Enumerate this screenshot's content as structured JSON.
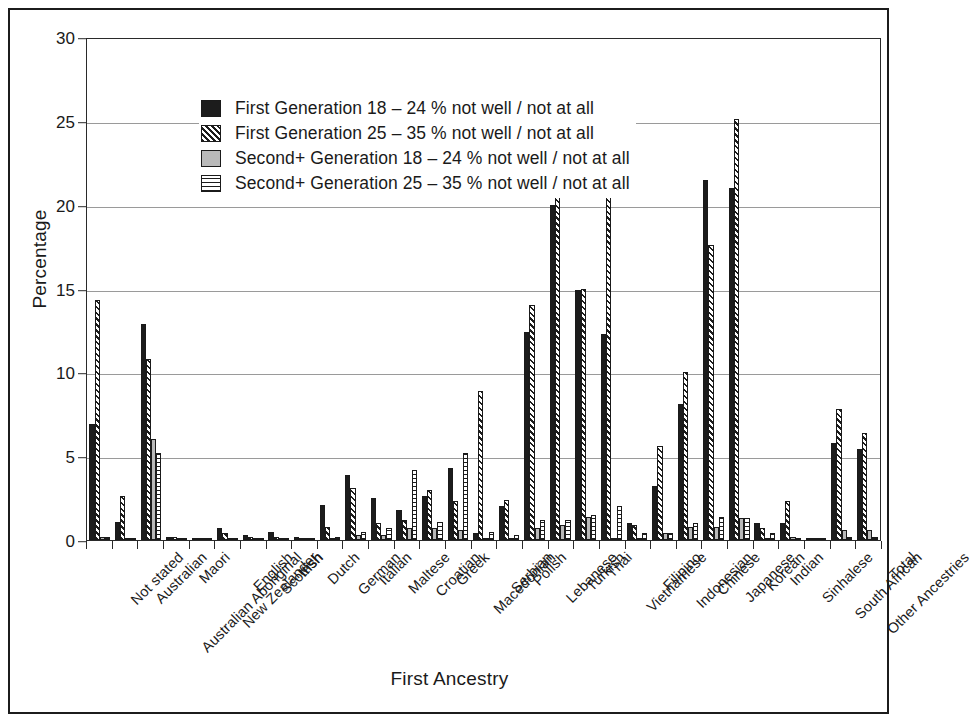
{
  "chart_data": {
    "type": "bar",
    "title": "",
    "xlabel": "First Ancestry",
    "ylabel": "Percentage",
    "ylim": [
      0,
      30
    ],
    "yticks": [
      0,
      5,
      10,
      15,
      20,
      25,
      30
    ],
    "grid": true,
    "legend_position": "top-left",
    "categories": [
      "Not stated",
      "Australian",
      "Australian Aboriginal",
      "Maori",
      "New Zealander",
      "English",
      "Scottish",
      "Irish",
      "Dutch",
      "German",
      "Italian",
      "Maltese",
      "Croatian",
      "Greek",
      "Macedonian",
      "Serbian",
      "Polish",
      "Lebanese",
      "Turkish",
      "Thai",
      "Vietnamese",
      "Filipino",
      "Indonesian",
      "Chinese",
      "Japanese",
      "Korean",
      "Indian",
      "Sinhalese",
      "South African",
      "Other Ancestries",
      "Total"
    ],
    "series": [
      {
        "name": "First Generation 18 – 24 % not well / not at all",
        "pattern": "solid-black",
        "color": "#1c1c1c",
        "values": [
          6.9,
          1.1,
          12.9,
          0.2,
          0.1,
          0.7,
          0.3,
          0.5,
          0.2,
          2.1,
          3.9,
          2.5,
          1.8,
          2.6,
          4.3,
          0.4,
          2.0,
          12.4,
          20.0,
          14.9,
          12.3,
          1.0,
          3.2,
          8.1,
          21.5,
          21.0,
          1.0,
          1.0,
          0.1,
          5.8,
          5.4
        ]
      },
      {
        "name": "First Generation 25 – 35 % not well / not at all",
        "pattern": "diagonal-hatch",
        "color": "#1c1c1c",
        "values": [
          14.3,
          2.6,
          10.8,
          0.2,
          0.1,
          0.4,
          0.2,
          0.2,
          0.1,
          0.8,
          3.1,
          1.0,
          1.2,
          3.0,
          2.3,
          8.9,
          2.4,
          14.0,
          22.1,
          15.0,
          23.7,
          0.9,
          5.6,
          10.0,
          17.6,
          25.1,
          0.7,
          2.3,
          0.1,
          7.8,
          6.4
        ]
      },
      {
        "name": "Second+ Generation 18 – 24 % not well / not at all",
        "pattern": "solid-gray",
        "color": "#b9b9b9",
        "values": [
          0.2,
          0.1,
          6.0,
          0.0,
          0.0,
          0.0,
          0.0,
          0.0,
          0.0,
          0.1,
          0.3,
          0.3,
          0.7,
          0.7,
          0.6,
          0.1,
          0.1,
          0.7,
          0.9,
          1.4,
          0.1,
          0.1,
          0.4,
          0.8,
          0.8,
          1.3,
          0.1,
          0.2,
          0.0,
          0.6,
          0.6
        ]
      },
      {
        "name": "Second+ Generation 25 – 35 % not well / not at all",
        "pattern": "horizontal-hatch",
        "color": "#1c1c1c",
        "values": [
          0.2,
          0.1,
          5.2,
          0.1,
          0.0,
          0.1,
          0.1,
          0.1,
          0.0,
          0.2,
          0.5,
          0.7,
          4.2,
          1.1,
          5.2,
          0.5,
          0.3,
          1.2,
          1.2,
          1.5,
          2.0,
          0.4,
          0.4,
          1.0,
          1.4,
          1.3,
          0.4,
          0.1,
          0.0,
          0.2,
          0.2
        ]
      }
    ]
  },
  "legend": {
    "items": [
      {
        "label": "First Generation 18 – 24 % not well / not at all"
      },
      {
        "label": "First Generation 25 – 35 % not well / not at all"
      },
      {
        "label": "Second+ Generation 18 – 24 % not well / not at all"
      },
      {
        "label": "Second+ Generation 25 – 35 % not well / not at all"
      }
    ]
  }
}
